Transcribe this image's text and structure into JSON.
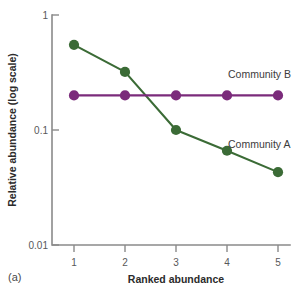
{
  "panel": {
    "label": "(a)"
  },
  "chart_data": {
    "type": "line",
    "title": "",
    "xlabel": "Ranked abundance",
    "ylabel": "Relative abundance (log scale)",
    "yscale": "log",
    "ylim": [
      0.01,
      1
    ],
    "xlim": [
      0.6,
      5.4
    ],
    "grid": false,
    "legend_position": "inline-right",
    "x": [
      1,
      2,
      3,
      4,
      5
    ],
    "categories": [
      "1",
      "2",
      "3",
      "4",
      "5"
    ],
    "ytick_labels": [
      "1",
      "0.1",
      "0.01"
    ],
    "ytick_values": [
      1,
      0.1,
      0.01
    ],
    "xtick_labels": [
      "1",
      "2",
      "3",
      "4",
      "5"
    ],
    "series": [
      {
        "name": "Community A",
        "color": "#3b6b36",
        "values": [
          0.55,
          0.32,
          0.1,
          0.066,
          0.043
        ]
      },
      {
        "name": "Community B",
        "color": "#7b2b7b",
        "values": [
          0.2,
          0.2,
          0.2,
          0.2,
          0.2
        ]
      }
    ],
    "annotations": [
      {
        "text": "Community B",
        "series": "Community B"
      },
      {
        "text": "Community A",
        "series": "Community A"
      }
    ]
  }
}
